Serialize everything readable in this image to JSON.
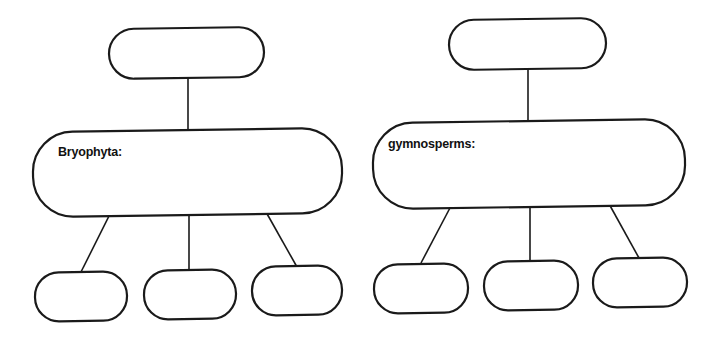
{
  "diagrams": [
    {
      "name": "bryophyta",
      "top_box": {
        "text": ""
      },
      "middle_box": {
        "label": "Bryophyta:"
      },
      "child_boxes": [
        {
          "text": ""
        },
        {
          "text": ""
        },
        {
          "text": ""
        }
      ]
    },
    {
      "name": "gymnosperms",
      "top_box": {
        "text": ""
      },
      "middle_box": {
        "label": "gymnosperms:"
      },
      "child_boxes": [
        {
          "text": ""
        },
        {
          "text": ""
        },
        {
          "text": ""
        }
      ]
    }
  ],
  "colors": {
    "stroke": "#1a1a1a",
    "background": "#ffffff"
  }
}
